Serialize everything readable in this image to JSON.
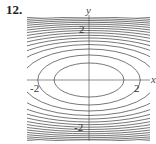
{
  "problem_number": "12.",
  "plot": {
    "type": "contour",
    "x_label": "x",
    "y_label": "y",
    "x_ticks": [
      "-2",
      "2"
    ],
    "y_ticks": [
      "2",
      "-2"
    ],
    "description": "Level curves: nested horizontal ellipses centered at origin, spacing decreasing outward"
  }
}
